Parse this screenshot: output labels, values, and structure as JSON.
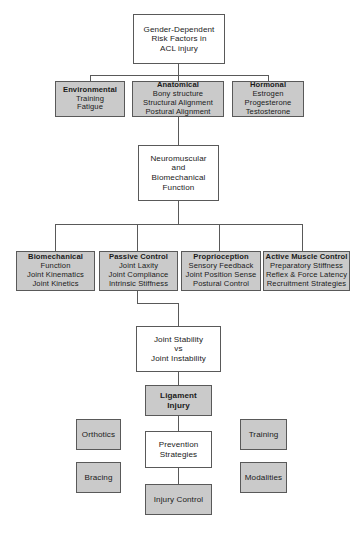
{
  "diagram": {
    "title_text": "Gender-Dependent Risk Factors in ACL Injury Flowchart",
    "colors": {
      "gray_fill": "#cacaca",
      "white_fill": "#ffffff",
      "border": "#595959",
      "text": "#1a1a1a"
    },
    "nodes": {
      "root": {
        "line1": "Gender-Dependent",
        "line2": "Risk Factors in",
        "line3": "ACL injury"
      },
      "environmental": {
        "heading": "Environmental",
        "item1": "Training",
        "item2": "Fatigue"
      },
      "anatomical": {
        "heading": "Anatomical",
        "item1": "Bony structure",
        "item2": "Structural Alignment",
        "item3": "Postural Alignment"
      },
      "hormonal": {
        "heading": "Hormonal",
        "item1": "Estrogen",
        "item2": "Progesterone",
        "item3": "Testosterone"
      },
      "neuromuscular": {
        "line1": "Neuromuscular",
        "line2": "and",
        "line3": "Biomechanical",
        "line4": "Function"
      },
      "biomechanical": {
        "heading": "Biomechanical",
        "item1": "Function",
        "item2": "Joint Kinematics",
        "item3": "Joint Kinetics"
      },
      "passive_control": {
        "heading": "Passive Control",
        "item1": "Joint Laxity",
        "item2": "Joint Compliance",
        "item3": "Intrinsic Stiffness"
      },
      "proprioception": {
        "heading": "Proprioception",
        "item1": "Sensory Feedback",
        "item2": "Joint Position Sense",
        "item3": "Postural Control"
      },
      "active_muscle_control": {
        "heading": "Active Muscle Control",
        "item1": "Preparatory Stiffness",
        "item2": "Reflex & Force Latency",
        "item3": "Recruitment Strategies"
      },
      "joint_stability": {
        "line1": "Joint Stability",
        "line2": "vs",
        "line3": "Joint Instability"
      },
      "ligament_injury": {
        "line1": "Ligament",
        "line2": "Injury"
      },
      "prevention_strategies": {
        "line1": "Prevention",
        "line2": "Strategies"
      },
      "injury_control": {
        "label": "Injury Control"
      },
      "orthotics": {
        "label": "Orthotics"
      },
      "bracing": {
        "label": "Bracing"
      },
      "training": {
        "label": "Training"
      },
      "modalities": {
        "label": "Modalities"
      }
    }
  }
}
